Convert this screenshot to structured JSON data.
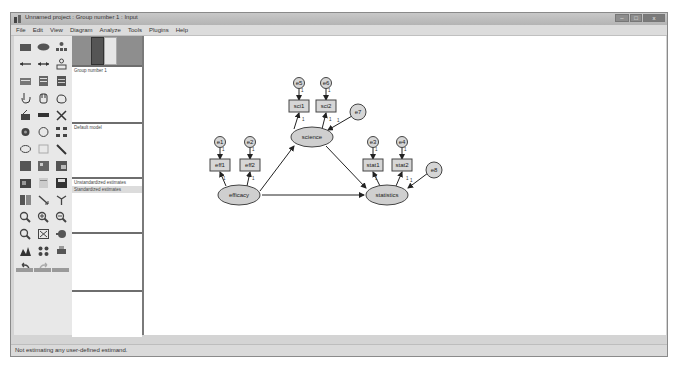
{
  "window": {
    "title": "Unnamed project : Group number 1 : Input",
    "controls": {
      "minimize": "–",
      "maximize": "□",
      "close": "x"
    }
  },
  "menu": [
    "File",
    "Edit",
    "View",
    "Diagram",
    "Analyze",
    "Tools",
    "Plugins",
    "Help"
  ],
  "toolbox": {
    "tools": [
      "draw-observed-variable-icon",
      "draw-unobserved-variable-icon",
      "draw-latent-indicator-icon",
      "draw-path-icon",
      "draw-covariance-icon",
      "add-unique-variable-icon",
      "list-variables-in-model-icon",
      "list-variables-in-dataset-icon",
      "select-one-object-icon",
      "select-all-objects-icon",
      "deselect-all-objects-icon",
      "duplicate-icon",
      "move-objects-icon",
      "erase-objects-icon",
      "change-shape-icon",
      "rotate-indicators-icon",
      "reflect-indicators-icon",
      "move-parameter-icon",
      "scroll-diagram-icon",
      "touch-up-icon",
      "select-data-files-icon",
      "analysis-properties-icon",
      "calculate-estimates-icon",
      "copy-to-clipboard-icon",
      "view-text-icon",
      "save-diagram-icon",
      "object-properties-icon",
      "drag-properties-icon",
      "preserve-symmetries-icon",
      "zoom-in-region-icon",
      "zoom-in-icon",
      "zoom-out-icon",
      "zoom-page-icon",
      "fit-to-page-icon",
      "loupe-icon",
      "bayesian-estimation-icon",
      "multiple-group-analysis-icon",
      "print-icon",
      "undo-icon",
      "redo-icon",
      "specification-search-icon"
    ]
  },
  "panels": {
    "groups": {
      "items": [
        "Group number 1"
      ]
    },
    "models": {
      "items": [
        "Default model"
      ]
    },
    "estimates": {
      "items": [
        "Unstandardized estimates",
        "Standardized estimates"
      ],
      "selected": 1
    }
  },
  "diagram": {
    "latent": [
      {
        "id": "efficacy",
        "label": "efficacy",
        "cx": 95,
        "cy": 159
      },
      {
        "id": "science",
        "label": "science",
        "cx": 168,
        "cy": 101
      },
      {
        "id": "statistics",
        "label": "statistics",
        "cx": 243,
        "cy": 159
      }
    ],
    "observed": [
      {
        "label": "eff1",
        "cx": 76,
        "cy": 129
      },
      {
        "label": "eff2",
        "cx": 106,
        "cy": 129
      },
      {
        "label": "sci1",
        "cx": 155,
        "cy": 70
      },
      {
        "label": "sci2",
        "cx": 182,
        "cy": 70
      },
      {
        "label": "stat1",
        "cx": 229,
        "cy": 129
      },
      {
        "label": "stat2",
        "cx": 258,
        "cy": 129
      }
    ],
    "errors": [
      {
        "label": "e1",
        "cx": 76,
        "cy": 106
      },
      {
        "label": "e2",
        "cx": 106,
        "cy": 106
      },
      {
        "label": "e5",
        "cx": 155,
        "cy": 47
      },
      {
        "label": "e6",
        "cx": 182,
        "cy": 47
      },
      {
        "label": "e3",
        "cx": 229,
        "cy": 106
      },
      {
        "label": "e4",
        "cx": 258,
        "cy": 106
      },
      {
        "label": "e7",
        "cx": 214,
        "cy": 76
      },
      {
        "label": "e8",
        "cx": 290,
        "cy": 134
      }
    ],
    "fixed_label": "1"
  },
  "status": {
    "text": "Not estimating any user-defined estimand."
  }
}
